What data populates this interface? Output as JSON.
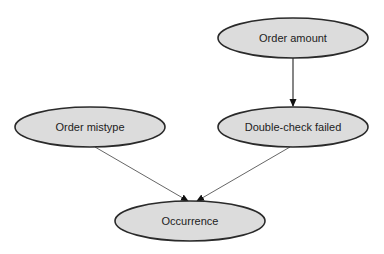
{
  "diagram": {
    "type": "directed-graph",
    "nodes": [
      {
        "id": "order_amount",
        "label": "Order amount",
        "cx": 293,
        "cy": 38,
        "rx": 75,
        "ry": 20
      },
      {
        "id": "order_mistype",
        "label": "Order mistype",
        "cx": 90,
        "cy": 127,
        "rx": 75,
        "ry": 20
      },
      {
        "id": "double_check_failed",
        "label": "Double-check failed",
        "cx": 293,
        "cy": 127,
        "rx": 75,
        "ry": 20
      },
      {
        "id": "occurrence",
        "label": "Occurrence",
        "cx": 190,
        "cy": 221,
        "rx": 75,
        "ry": 20
      }
    ],
    "edges": [
      {
        "from": "order_amount",
        "to": "double_check_failed"
      },
      {
        "from": "order_mistype",
        "to": "occurrence"
      },
      {
        "from": "double_check_failed",
        "to": "occurrence"
      }
    ],
    "colors": {
      "node_fill": "#dcdcdc",
      "node_stroke": "#2a2a2a",
      "edge": "#555555",
      "background": "#ffffff"
    }
  }
}
